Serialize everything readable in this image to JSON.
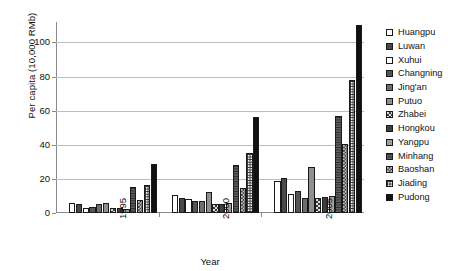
{
  "chart_data": {
    "type": "bar",
    "title": "",
    "xlabel": "Year",
    "ylabel": "Per capita (10,000 RMb)",
    "categories": [
      "1995",
      "2000",
      "2005"
    ],
    "ylim": [
      0,
      112
    ],
    "yticks": [
      0,
      20,
      40,
      60,
      80,
      100
    ],
    "grid": true,
    "legend_position": "right",
    "series": [
      {
        "name": "Huangpu",
        "values": [
          5.6,
          10.6,
          19.0
        ]
      },
      {
        "name": "Luwan",
        "values": [
          5.4,
          8.6,
          20.6
        ]
      },
      {
        "name": "Xuhui",
        "values": [
          3.0,
          8.0,
          11.3
        ]
      },
      {
        "name": "Changning",
        "values": [
          3.3,
          6.8,
          13.0
        ]
      },
      {
        "name": "Jing'an",
        "values": [
          5.4,
          7.3,
          9.0
        ]
      },
      {
        "name": "Putuo",
        "values": [
          5.6,
          12.1,
          27.2
        ]
      },
      {
        "name": "Zhabei",
        "values": [
          2.7,
          5.2,
          9.0
        ]
      },
      {
        "name": "Hongkou",
        "values": [
          2.7,
          5.5,
          9.6
        ]
      },
      {
        "name": "Yangpu",
        "values": [
          2.6,
          5.6,
          9.8
        ]
      },
      {
        "name": "Minhang",
        "values": [
          15.1,
          27.9,
          56.7
        ]
      },
      {
        "name": "Baoshan",
        "values": [
          7.5,
          14.5,
          40.2
        ]
      },
      {
        "name": "Jiading",
        "values": [
          16.4,
          35.4,
          78.2
        ]
      },
      {
        "name": "Pudong",
        "values": [
          28.5,
          56.2,
          110.0
        ]
      }
    ]
  },
  "legend": {
    "items": [
      {
        "label": "Huangpu"
      },
      {
        "label": "Luwan"
      },
      {
        "label": "Xuhui"
      },
      {
        "label": "Changning"
      },
      {
        "label": "Jing'an"
      },
      {
        "label": "Putuo"
      },
      {
        "label": "Zhabei"
      },
      {
        "label": "Hongkou"
      },
      {
        "label": "Yangpu"
      },
      {
        "label": "Minhang"
      },
      {
        "label": "Baoshan"
      },
      {
        "label": "Jiading"
      },
      {
        "label": "Pudong"
      }
    ]
  }
}
